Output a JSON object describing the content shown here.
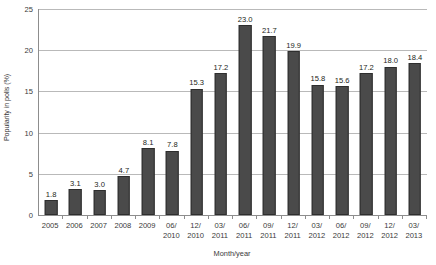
{
  "chart_data": {
    "type": "bar",
    "title": "",
    "xlabel": "Month/year",
    "ylabel": "Popularity in polls (%)",
    "ylim": [
      0,
      25
    ],
    "yticks": [
      0,
      5,
      10,
      15,
      20,
      25
    ],
    "ytick_labels": [
      "0",
      "5",
      "10",
      "15",
      "20",
      "25"
    ],
    "grid": "horizontal",
    "legend": "none",
    "bar_color": "#4a4a4a",
    "gridline_color": "#b9b9b9",
    "axis_color": "#8d8d8d",
    "categories": [
      "2005",
      "2006",
      "2007",
      "2008",
      "2009",
      "06/ 2010",
      "12/ 2010",
      "03/ 2011",
      "06/ 2011",
      "09/ 2011",
      "12/ 2011",
      "03/ 2012",
      "06/ 2012",
      "09/ 2012",
      "12/ 2012",
      "03/ 2013"
    ],
    "category_lines": [
      [
        "2005",
        ""
      ],
      [
        "2006",
        ""
      ],
      [
        "2007",
        ""
      ],
      [
        "2008",
        ""
      ],
      [
        "2009",
        ""
      ],
      [
        "06/",
        "2010"
      ],
      [
        "12/",
        "2010"
      ],
      [
        "03/",
        "2011"
      ],
      [
        "06/",
        "2011"
      ],
      [
        "09/",
        "2011"
      ],
      [
        "12/",
        "2011"
      ],
      [
        "03/",
        "2012"
      ],
      [
        "06/",
        "2012"
      ],
      [
        "09/",
        "2012"
      ],
      [
        "12/",
        "2012"
      ],
      [
        "03/",
        "2013"
      ]
    ],
    "values": [
      1.8,
      3.1,
      3.0,
      4.7,
      8.1,
      7.8,
      15.3,
      17.2,
      23.0,
      21.7,
      19.9,
      15.8,
      15.6,
      17.2,
      18.0,
      18.4
    ],
    "value_labels": [
      "1.8",
      "3.1",
      "3.0",
      "4.7",
      "8.1",
      "7.8",
      "15.3",
      "17.2",
      "23.0",
      "21.7",
      "19.9",
      "15.8",
      "15.6",
      "17.2",
      "18.0",
      "18.4"
    ]
  }
}
